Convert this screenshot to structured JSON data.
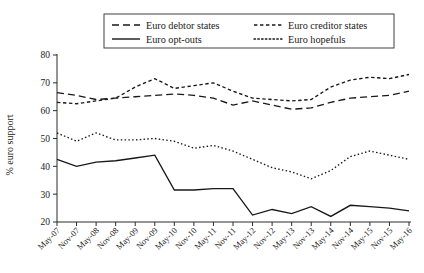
{
  "chart_data": {
    "type": "line",
    "title": "",
    "subtitle": "",
    "xlabel": "",
    "ylabel": "% euro support",
    "ylim": [
      20,
      80
    ],
    "yticks": [
      20,
      30,
      40,
      50,
      60,
      70,
      80
    ],
    "grid": false,
    "legend_position": "top-center",
    "x": [
      "May-07",
      "Nov-07",
      "May-08",
      "Nov-08",
      "May-09",
      "Nov-09",
      "May-10",
      "Nov-10",
      "May-11",
      "Nov-11",
      "May-12",
      "Nov-12",
      "May-13",
      "Nov-13",
      "May-14",
      "Nov-14",
      "May-15",
      "Nov-15",
      "May-16"
    ],
    "categories": [
      "May-07",
      "Nov-07",
      "May-08",
      "Nov-08",
      "May-09",
      "Nov-09",
      "May-10",
      "Nov-10",
      "May-11",
      "Nov-11",
      "May-12",
      "Nov-12",
      "May-13",
      "Nov-13",
      "May-14",
      "Nov-14",
      "May-15",
      "Nov-15",
      "May-16"
    ],
    "series": [
      {
        "name": "Euro debtor states",
        "style": "dashed",
        "values": [
          66.5,
          65.5,
          64.0,
          64.5,
          65.0,
          65.5,
          66.0,
          65.5,
          64.5,
          62.0,
          63.5,
          62.0,
          60.5,
          61.0,
          63.0,
          64.5,
          65.0,
          65.5,
          67.0
        ]
      },
      {
        "name": "Euro creditor states",
        "style": "fine-dashed",
        "values": [
          63.0,
          62.5,
          63.5,
          64.5,
          68.5,
          71.5,
          68.0,
          69.0,
          70.0,
          67.0,
          64.5,
          64.0,
          63.5,
          64.0,
          68.5,
          71.0,
          72.0,
          71.5,
          73.0
        ]
      },
      {
        "name": "Euro opt-outs",
        "style": "solid",
        "values": [
          42.5,
          40.0,
          41.5,
          42.0,
          43.0,
          44.0,
          31.5,
          31.5,
          32.0,
          32.0,
          22.5,
          24.5,
          23.0,
          25.5,
          22.0,
          26.0,
          25.5,
          25.0,
          24.0
        ]
      },
      {
        "name": "Euro hopefuls",
        "style": "dotted",
        "values": [
          52.0,
          49.0,
          52.0,
          49.5,
          49.5,
          50.0,
          49.0,
          46.5,
          47.5,
          45.5,
          42.5,
          39.5,
          38.0,
          35.5,
          38.5,
          43.5,
          45.5,
          44.0,
          42.5
        ]
      }
    ],
    "legend": [
      {
        "label": "Euro debtor states",
        "style": "dashed"
      },
      {
        "label": "Euro creditor states",
        "style": "fine-dashed"
      },
      {
        "label": "Euro opt-outs",
        "style": "solid"
      },
      {
        "label": "Euro hopefuls",
        "style": "dotted"
      }
    ]
  }
}
